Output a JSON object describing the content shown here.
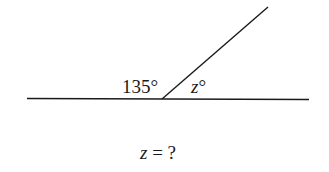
{
  "diagram": {
    "angle_known_label": "135°",
    "angle_unknown_var": "z",
    "angle_unknown_deg": "°",
    "question_var": "z",
    "question_rest": " = ?",
    "line_color": "#1a1a1a"
  }
}
